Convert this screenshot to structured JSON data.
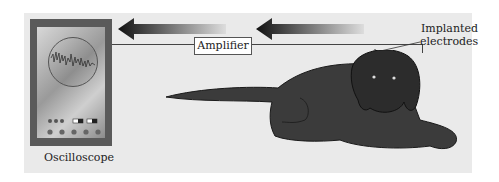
{
  "labels": {
    "oscilloscope": "Oscilloscope",
    "amplifier": "Amplifier",
    "electrodes_line1": "Implanted",
    "electrodes_line2": "electrodes"
  },
  "colors": {
    "panel_bg": "#eaeaea",
    "device_frame": "#5a5a5a",
    "dog": "#3a3a3a",
    "arrow_dark": "#1a1a1a"
  }
}
